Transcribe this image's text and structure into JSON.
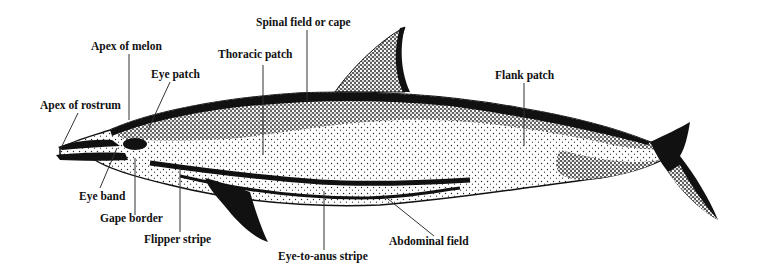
{
  "diagram": {
    "labels": {
      "apex_of_rostrum": "Apex of rostrum",
      "apex_of_melon": "Apex of melon",
      "eye_patch": "Eye patch",
      "thoracic_patch": "Thoracic patch",
      "spinal_field": "Spinal field or cape",
      "flank_patch": "Flank patch",
      "eye_band": "Eye band",
      "gape_border": "Gape border",
      "flipper_stripe": "Flipper stripe",
      "eye_to_anus_stripe": "Eye-to-anus stripe",
      "abdominal_field": "Abdominal field"
    },
    "colors": {
      "ink": "#111111",
      "background": "#ffffff",
      "light": "#f4f4f4"
    }
  }
}
